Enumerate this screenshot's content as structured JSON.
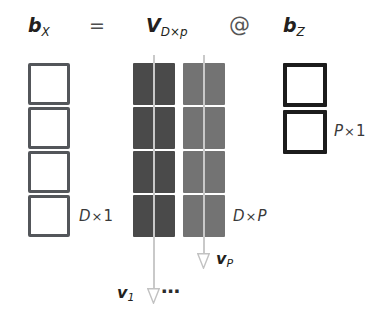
{
  "equation": {
    "lhs": {
      "symbol": "b",
      "subscript": "X"
    },
    "equals": "=",
    "matrix": {
      "symbol": "V",
      "subscript": "D×p"
    },
    "operator": "@",
    "rhs": {
      "symbol": "b",
      "subscript": "Z"
    }
  },
  "lhs_vector": {
    "cell_count": 4,
    "dimension_label": {
      "rows": "D",
      "times": "×",
      "cols": "1"
    },
    "style": "hollow",
    "border_color": "#53565a",
    "fill_color": "#ffffff"
  },
  "matrix": {
    "rows": 4,
    "cols": 2,
    "dimension_label": {
      "rows": "D",
      "times": "×",
      "cols": "P"
    },
    "column_colors": [
      "#4a4a4a",
      "#737373"
    ],
    "cells": [
      [
        "#4a4a4a",
        "#737373"
      ],
      [
        "#4a4a4a",
        "#737373"
      ],
      [
        "#4a4a4a",
        "#737373"
      ],
      [
        "#4a4a4a",
        "#737373"
      ]
    ]
  },
  "rhs_vector": {
    "cell_count": 2,
    "dimension_label": {
      "rows": "P",
      "times": "×",
      "cols": "1"
    },
    "style": "hollow",
    "border_color": "#1c1c1c",
    "fill_color": "#ffffff"
  },
  "column_arrows": {
    "arrow_color": "#c9c9c9",
    "ellipsis": "⋯",
    "items": [
      {
        "label_symbol": "v",
        "label_subscript": "1"
      },
      {
        "label_symbol": "v",
        "label_subscript": "P"
      }
    ]
  },
  "colors": {
    "background": "#ffffff",
    "ink": "#231f20",
    "dim_text": "#3a3a3a",
    "matrix_dark": "#4a4a4a",
    "matrix_light": "#737373"
  }
}
